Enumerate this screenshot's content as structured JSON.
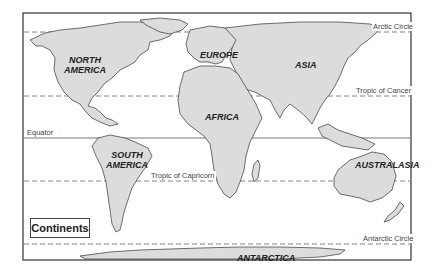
{
  "title": "Continents",
  "colors": {
    "land": "#dcdcdc",
    "outline": "#333333",
    "background": "#ffffff"
  },
  "continents": [
    {
      "name": "NORTH\nAMERICA",
      "line1": "NORTH",
      "line2": "AMERICA"
    },
    {
      "name": "EUROPE",
      "line1": "EUROPE"
    },
    {
      "name": "ASIA",
      "line1": "ASIA"
    },
    {
      "name": "AFRICA",
      "line1": "AFRICA"
    },
    {
      "name": "SOUTH\nAMERICA",
      "line1": "SOUTH",
      "line2": "AMERICA"
    },
    {
      "name": "AUSTRALASIA",
      "line1": "AUSTRALASIA"
    },
    {
      "name": "ANTARCTICA",
      "line1": "ANTARCTICA"
    }
  ],
  "lines": {
    "arctic_circle": "Arctic Circle",
    "tropic_of_cancer": "Tropic of Cancer",
    "equator": "Equator",
    "tropic_of_capricorn": "Tropic of Capricorn",
    "antarctic_circle": "Antarctic Circle"
  }
}
